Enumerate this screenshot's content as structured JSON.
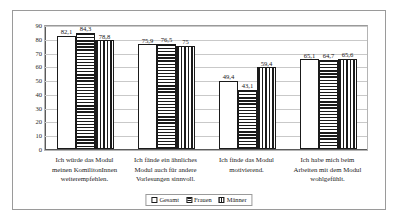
{
  "chart_data": {
    "type": "bar",
    "title": "",
    "subtitle": "",
    "xlabel": "",
    "ylabel": "",
    "ylim": [
      0,
      90
    ],
    "ytick_step": 10,
    "yticks": [
      "90",
      "80",
      "70",
      "60",
      "50",
      "40",
      "30",
      "20",
      "10",
      "0"
    ],
    "grid": true,
    "legend_position": "bottom-center",
    "decimal_separator": ",",
    "categories": [
      "Ich würde das Modul meinen KomilitonInnen weiterempfehlen.",
      "Ich fände ein ähnliches Modul auch für andere Vorlesungen sinnvoll.",
      "Ich finde das Modul motivierend.",
      "Ich habe mich beim Arbeiten mit dem Modul wohlgefühlt."
    ],
    "series": [
      {
        "name": "Gesamt",
        "pattern": "solid",
        "values": [
          82.1,
          76.0,
          49.4,
          65.1
        ],
        "labels": [
          "82,1",
          "75,9",
          "49,4",
          "65,1"
        ]
      },
      {
        "name": "Frauen",
        "pattern": "hstripe",
        "values": [
          84.3,
          76.5,
          43.1,
          64.7
        ],
        "labels": [
          "84,3",
          "76,5",
          "43,1",
          "64,7"
        ]
      },
      {
        "name": "Männer",
        "pattern": "vstripe",
        "values": [
          78.8,
          75.0,
          59.4,
          65.6
        ],
        "labels": [
          "78,8",
          "75",
          "59,4",
          "65,6"
        ]
      }
    ],
    "colors": {
      "bar_outline": "#1a1a1a",
      "bar_fill": "#ffffff",
      "gridline": "#c9c9c9",
      "axis": "#5a5a5a",
      "frame": "#9a9a9a",
      "text": "#1a1a1a"
    }
  }
}
